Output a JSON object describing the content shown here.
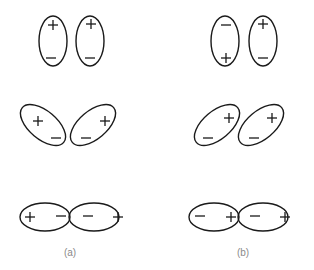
{
  "figure": {
    "panels": [
      {
        "label": "(a)",
        "label_pos": [
          70,
          253
        ],
        "rows": [
          {
            "name": "vertical-pair",
            "lobes": [
              {
                "cx": 53,
                "cy": 41,
                "rx": 14,
                "ry": 25,
                "rot": 0,
                "signs": [
                  {
                    "s": "+",
                    "x": 53,
                    "y": 25
                  },
                  {
                    "s": "-",
                    "x": 51,
                    "y": 58
                  }
                ]
              },
              {
                "cx": 90,
                "cy": 41,
                "rx": 14,
                "ry": 25,
                "rot": 0,
                "signs": [
                  {
                    "s": "+",
                    "x": 91,
                    "y": 24
                  },
                  {
                    "s": "-",
                    "x": 90,
                    "y": 58
                  }
                ]
              }
            ]
          },
          {
            "name": "tilted-pair",
            "lobes": [
              {
                "cx": 43,
                "cy": 125,
                "rx": 27,
                "ry": 14,
                "rot": 40,
                "signs": [
                  {
                    "s": "+",
                    "x": 38,
                    "y": 121
                  },
                  {
                    "s": "-",
                    "x": 56,
                    "y": 138
                  }
                ]
              },
              {
                "cx": 93,
                "cy": 125,
                "rx": 27,
                "ry": 14,
                "rot": -40,
                "signs": [
                  {
                    "s": "+",
                    "x": 105,
                    "y": 121
                  },
                  {
                    "s": "-",
                    "x": 86,
                    "y": 138
                  }
                ]
              }
            ]
          },
          {
            "name": "horizontal-pair",
            "lobes": [
              {
                "cx": 45,
                "cy": 217,
                "rx": 25,
                "ry": 14,
                "rot": 0,
                "signs": [
                  {
                    "s": "+",
                    "x": 30,
                    "y": 217
                  },
                  {
                    "s": "-",
                    "x": 61,
                    "y": 216
                  }
                ]
              },
              {
                "cx": 94,
                "cy": 217,
                "rx": 25,
                "ry": 14,
                "rot": 0,
                "signs": [
                  {
                    "s": "-",
                    "x": 88,
                    "y": 216
                  },
                  {
                    "s": "+",
                    "x": 118,
                    "y": 217
                  }
                ]
              }
            ]
          }
        ]
      },
      {
        "label": "(b)",
        "label_pos": [
          243,
          253
        ],
        "rows": [
          {
            "name": "vertical-pair",
            "lobes": [
              {
                "cx": 225,
                "cy": 41,
                "rx": 14,
                "ry": 25,
                "rot": 0,
                "signs": [
                  {
                    "s": "-",
                    "x": 226,
                    "y": 25
                  },
                  {
                    "s": "+",
                    "x": 226,
                    "y": 58
                  }
                ]
              },
              {
                "cx": 263,
                "cy": 41,
                "rx": 14,
                "ry": 25,
                "rot": 0,
                "signs": [
                  {
                    "s": "+",
                    "x": 263,
                    "y": 24
                  },
                  {
                    "s": "-",
                    "x": 263,
                    "y": 58
                  }
                ]
              }
            ]
          },
          {
            "name": "tilted-pair",
            "lobes": [
              {
                "cx": 217,
                "cy": 125,
                "rx": 27,
                "ry": 14,
                "rot": -40,
                "signs": [
                  {
                    "s": "+",
                    "x": 229,
                    "y": 118
                  },
                  {
                    "s": "-",
                    "x": 208,
                    "y": 138
                  }
                ]
              },
              {
                "cx": 261,
                "cy": 125,
                "rx": 27,
                "ry": 14,
                "rot": -40,
                "signs": [
                  {
                    "s": "+",
                    "x": 272,
                    "y": 118
                  },
                  {
                    "s": "-",
                    "x": 254,
                    "y": 138
                  }
                ]
              }
            ]
          },
          {
            "name": "horizontal-pair",
            "lobes": [
              {
                "cx": 214,
                "cy": 217,
                "rx": 25,
                "ry": 14,
                "rot": 0,
                "signs": [
                  {
                    "s": "-",
                    "x": 200,
                    "y": 216
                  },
                  {
                    "s": "+",
                    "x": 231,
                    "y": 217
                  }
                ]
              },
              {
                "cx": 263,
                "cy": 217,
                "rx": 25,
                "ry": 14,
                "rot": 0,
                "signs": [
                  {
                    "s": "-",
                    "x": 255,
                    "y": 216
                  },
                  {
                    "s": "+",
                    "x": 285,
                    "y": 217
                  }
                ]
              }
            ]
          }
        ]
      }
    ],
    "colors": {
      "stroke": "#1a1a1a",
      "caption": "#8a8a8a",
      "background": "#ffffff"
    }
  }
}
